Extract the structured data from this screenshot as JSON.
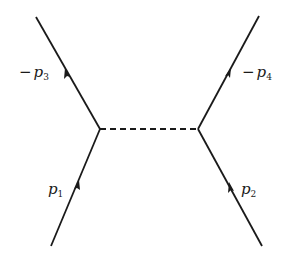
{
  "diagram": {
    "type": "feynman",
    "line_color": "#1a1a1a",
    "external_lines": [
      {
        "id": "p1",
        "label_sign": "",
        "label_base": "p",
        "label_sub": "1",
        "position": "bottom-left",
        "arrow": "toward-vertex"
      },
      {
        "id": "p2",
        "label_sign": "",
        "label_base": "p",
        "label_sub": "2",
        "position": "bottom-right",
        "arrow": "toward-vertex"
      },
      {
        "id": "p3",
        "label_sign": "−",
        "label_base": "p",
        "label_sub": "3",
        "position": "top-left",
        "arrow": "away-from-vertex"
      },
      {
        "id": "p4",
        "label_sign": "−",
        "label_base": "p",
        "label_sub": "4",
        "position": "top-right",
        "arrow": "away-from-vertex"
      }
    ],
    "internal_line": {
      "style": "dashed",
      "connects": [
        "left-vertex",
        "right-vertex"
      ]
    }
  }
}
